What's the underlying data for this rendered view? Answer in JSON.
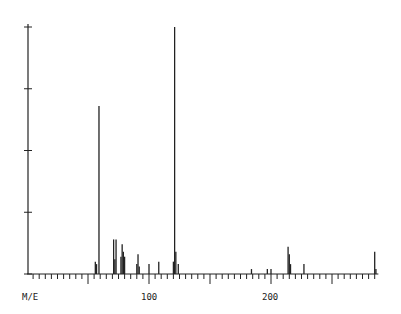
{
  "chart_data": {
    "type": "bar",
    "title": "",
    "xlabel": "M/E",
    "ylabel": "",
    "xlim": [
      0,
      288
    ],
    "ylim": [
      0,
      100
    ],
    "grid": false,
    "legend": null,
    "x_ticks_labeled": [
      100,
      200
    ],
    "x_minor_tick_step": 5,
    "x_major_tick_step": 10,
    "y_ticks": [
      0,
      25,
      50,
      75,
      100
    ],
    "peaks": [
      {
        "mz": 56,
        "intensity": 5
      },
      {
        "mz": 57,
        "intensity": 4
      },
      {
        "mz": 59,
        "intensity": 68
      },
      {
        "mz": 71,
        "intensity": 14
      },
      {
        "mz": 72,
        "intensity": 6
      },
      {
        "mz": 73,
        "intensity": 14
      },
      {
        "mz": 77,
        "intensity": 7
      },
      {
        "mz": 78,
        "intensity": 12
      },
      {
        "mz": 79,
        "intensity": 9
      },
      {
        "mz": 80,
        "intensity": 7
      },
      {
        "mz": 90,
        "intensity": 4
      },
      {
        "mz": 91,
        "intensity": 8
      },
      {
        "mz": 92,
        "intensity": 3
      },
      {
        "mz": 100,
        "intensity": 4
      },
      {
        "mz": 108,
        "intensity": 5
      },
      {
        "mz": 120,
        "intensity": 5
      },
      {
        "mz": 121,
        "intensity": 100
      },
      {
        "mz": 122,
        "intensity": 9
      },
      {
        "mz": 124,
        "intensity": 4
      },
      {
        "mz": 184,
        "intensity": 2
      },
      {
        "mz": 197,
        "intensity": 2
      },
      {
        "mz": 200,
        "intensity": 2
      },
      {
        "mz": 214,
        "intensity": 11
      },
      {
        "mz": 215,
        "intensity": 8
      },
      {
        "mz": 216,
        "intensity": 4
      },
      {
        "mz": 227,
        "intensity": 4
      },
      {
        "mz": 285,
        "intensity": 9
      },
      {
        "mz": 286,
        "intensity": 2
      }
    ]
  },
  "axis": {
    "x_label": "M/E",
    "tick_label_100": "100",
    "tick_label_200": "200"
  },
  "style": {
    "line_color": "#222222",
    "background": "#ffffff"
  }
}
